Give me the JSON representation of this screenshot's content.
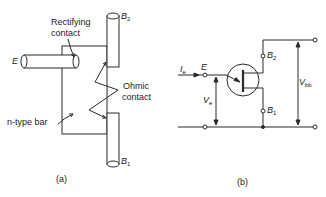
{
  "figure": {
    "panel_a": {
      "caption": "(a)",
      "labels": {
        "emitter": "E",
        "rectifying_line1": "Rectifying",
        "rectifying_line2": "contact",
        "b2_main": "B",
        "b2_sub": "2",
        "b1_main": "B",
        "b1_sub": "1",
        "ohmic_line1": "Ohmic",
        "ohmic_line2": "contact",
        "bar": "n-type bar"
      }
    },
    "panel_b": {
      "caption": "(b)",
      "labels": {
        "ie_main": "I",
        "ie_sub": "e",
        "emitter": "E",
        "b2_main": "B",
        "b2_sub": "2",
        "b1_main": "B",
        "b1_sub": "1",
        "ve_main": "V",
        "ve_sub": "e",
        "vbb_main": "V",
        "vbb_sub": "bb"
      }
    },
    "colors": {
      "stroke": "#2a2a2a",
      "background": "#ffffff"
    }
  }
}
